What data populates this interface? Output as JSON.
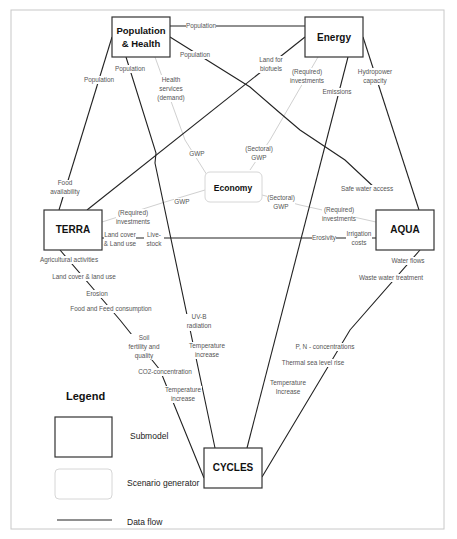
{
  "diagram": {
    "submodels": {
      "population_health": {
        "line1": "Population",
        "line2": "& Health"
      },
      "energy": "Energy",
      "terra": "TERRA",
      "aqua": "AQUA",
      "cycles": "CYCLES"
    },
    "scenario_generator": {
      "economy": "Economy"
    },
    "flows": {
      "pop_energy_top": "Population",
      "pop_energy_diag": "Population",
      "pop_terra": "Population",
      "pop_cycles": "Population",
      "health_services": [
        "Health",
        "services",
        "(demand)"
      ],
      "gwp_pop": "GWP",
      "land_biofuels": [
        "Land for",
        "biofuels"
      ],
      "req_invest_energy": [
        "(Required)",
        "investments"
      ],
      "emissions": "Emissions",
      "hydropower": [
        "Hydropower",
        "capacity"
      ],
      "sectoral_gwp_energy": [
        "(Sectoral)",
        "GWP"
      ],
      "food_availability": [
        "Food",
        "availability"
      ],
      "gwp_terra": "GWP",
      "req_invest_terra": [
        "(Required)",
        "investments"
      ],
      "land_cover_land_use": [
        "Land cover",
        "& Land use"
      ],
      "livestock": [
        "Live-",
        "stock"
      ],
      "safe_water": "Safe water access",
      "sectoral_gwp_aqua": [
        "(Sectoral)",
        "GWP"
      ],
      "req_invest_aqua": [
        "(Required)",
        "investments"
      ],
      "erosivity": "Erosivity",
      "irrigation_costs": [
        "Irrigation",
        "costs"
      ],
      "terra_cycles": [
        "Agricultural activities",
        "Land cover & land use",
        "Erosion",
        "Food and Feed consumption"
      ],
      "soil_fertility": [
        "Soil",
        "fertility and",
        "quality"
      ],
      "co2": "CO2-concentration",
      "temp_increase_terra": [
        "Temperature",
        "increase"
      ],
      "uvb": [
        "UV-B",
        "radiation"
      ],
      "temp_increase_pop": [
        "Temperature",
        "increase"
      ],
      "water_flows": "Water flows",
      "waste_water": "Waste water treatment",
      "pn_conc": "P, N - concentrations",
      "thermal_sea": "Thermal sea level rise",
      "temp_increase_aqua": [
        "Temperature",
        "Increase"
      ]
    },
    "legend": {
      "title": "Legend",
      "submodel": "Submodel",
      "scenario_generator": "Scenario generator",
      "data_flow": "Data flow"
    }
  }
}
